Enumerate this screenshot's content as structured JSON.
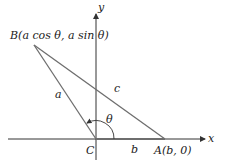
{
  "diagram": {
    "type": "triangle-coordinate-figure",
    "axes": {
      "x_label": "x",
      "y_label": "y"
    },
    "points": {
      "B": {
        "label": "B(a cos θ, a sin θ)"
      },
      "C": {
        "label": "C"
      },
      "A": {
        "label": "A(b, 0)"
      }
    },
    "sides": {
      "a": "a",
      "b": "b",
      "c": "c"
    },
    "angle": {
      "label": "θ"
    },
    "colors": {
      "line": "#6e6e6e",
      "axis": "#333333",
      "text": "#222222"
    }
  }
}
